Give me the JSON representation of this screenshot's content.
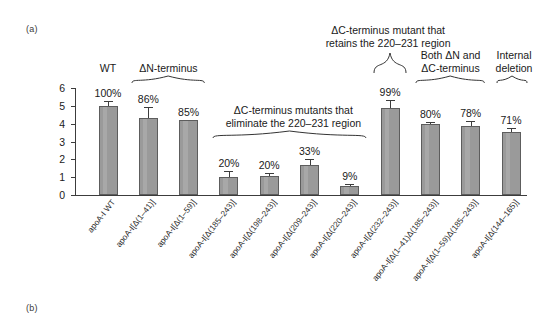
{
  "panels": {
    "a": "(a)",
    "b": "(b)"
  },
  "axes": {
    "y_title_line1": "cAMP-dependent [3H] cholesterol efflux",
    "y_title_line2": "(% of total cholesterol)",
    "y_ticks": [
      "0",
      "1",
      "2",
      "3",
      "4",
      "5",
      "6"
    ],
    "y_min": 0,
    "y_max": 6
  },
  "chart_data": {
    "type": "bar",
    "title": "",
    "xlabel": "",
    "ylabel": "cAMP-dependent [3H] cholesterol efflux (% of total cholesterol)",
    "ylim": [
      0,
      6
    ],
    "grid": false,
    "legend": "none",
    "categories": [
      "apoA-I WT",
      "apoA-I[Δ(1–41)]",
      "apoA-I[Δ(1–59)]",
      "apoA-I[Δ(185–243)]",
      "apoA-I[Δ(198–243)]",
      "apoA-I[Δ(209–243)]",
      "apoA-I[Δ(220–243)]",
      "apoA-I[Δ(232–243)]",
      "apoA-I[Δ(1–41)Δ(185–243)]",
      "apoA-I[Δ(1–59)Δ(185–243)]",
      "apoA-I[Δ(144–165)]"
    ],
    "values": [
      5.0,
      4.3,
      4.2,
      1.0,
      1.05,
      1.67,
      0.5,
      4.9,
      4.0,
      3.87,
      3.52
    ],
    "errors": [
      0.28,
      0.62,
      0.0,
      0.33,
      0.17,
      0.36,
      0.1,
      0.43,
      0.12,
      0.3,
      0.22
    ],
    "data_labels": [
      "100%",
      "86%",
      "85%",
      "20%",
      "20%",
      "33%",
      "9%",
      "99%",
      "80%",
      "78%",
      "71%"
    ]
  },
  "group_annotations": [
    {
      "name": "wt",
      "text_line1": "WT",
      "text_line2": "",
      "brace": false
    },
    {
      "name": "n-terminus",
      "text_line1": "ΔN-terminus",
      "text_line2": "",
      "brace": true
    },
    {
      "name": "c-terminus-eliminate",
      "text_line1": "ΔC-terminus mutants that",
      "text_line2": "eliminate the 220–231 region",
      "brace": true
    },
    {
      "name": "c-terminus-retains",
      "text_line1": "ΔC-terminus mutant that",
      "text_line2": "retains the 220–231 region",
      "brace": true
    },
    {
      "name": "both-n-and-c",
      "text_line1": "Both ΔN and",
      "text_line2": "ΔC-terminus",
      "brace": true
    },
    {
      "name": "internal-deletion",
      "text_line1": "Internal",
      "text_line2": "deletion",
      "brace": true
    }
  ],
  "colors": {
    "bar_fill": "#9a9a9a",
    "bar_stroke": "#5d5d5d",
    "axis": "#3c3c3c",
    "text": "#1a1a1a",
    "background": "#ffffff"
  }
}
